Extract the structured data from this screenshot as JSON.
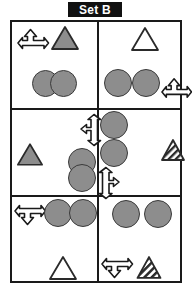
{
  "title": {
    "label": "Set B"
  },
  "colors": {
    "title_background": "#111111",
    "title_text": "#ffffff",
    "border": "#1a1a1a",
    "circle_fill": "#8d8d8d",
    "circle_stroke": "#3a3a3a",
    "triangle_gray_fill": "#8d8d8d",
    "triangle_white_fill": "#ffffff",
    "triangle_stroke": "#2a2a2a",
    "arrow_fill": "#ffffff",
    "arrow_stroke": "#1a1a1a",
    "background": "#ffffff"
  },
  "grid": {
    "rows": 3,
    "columns": 2,
    "cells": [
      {
        "id": "top-left",
        "objects": [
          {
            "kind": "arrow",
            "directions": "left-up-right",
            "name": "arrow-left-up-right"
          },
          {
            "kind": "triangle",
            "fill": "gray",
            "name": "triangle-gray"
          },
          {
            "kind": "circle",
            "fill": "gray",
            "name": "circle-gray"
          },
          {
            "kind": "circle",
            "fill": "gray",
            "name": "circle-gray"
          }
        ],
        "counts": {
          "arrows": 1,
          "triangles": 1,
          "circles": 2
        }
      },
      {
        "id": "top-right",
        "objects": [
          {
            "kind": "triangle",
            "fill": "white",
            "name": "triangle-white"
          },
          {
            "kind": "circle",
            "fill": "gray",
            "name": "circle-gray"
          },
          {
            "kind": "circle",
            "fill": "gray",
            "name": "circle-gray"
          },
          {
            "kind": "arrow",
            "directions": "left-up-right",
            "name": "arrow-left-up-right"
          }
        ],
        "counts": {
          "arrows": 1,
          "triangles": 1,
          "circles": 2
        }
      },
      {
        "id": "middle-left",
        "objects": [
          {
            "kind": "arrow",
            "directions": "left-up-down",
            "name": "arrow-left-up-down"
          },
          {
            "kind": "triangle",
            "fill": "gray",
            "name": "triangle-gray"
          },
          {
            "kind": "circle",
            "fill": "gray",
            "name": "circle-gray"
          },
          {
            "kind": "circle",
            "fill": "gray",
            "name": "circle-gray"
          }
        ],
        "counts": {
          "arrows": 1,
          "triangles": 1,
          "circles": 2
        }
      },
      {
        "id": "middle-right",
        "objects": [
          {
            "kind": "circle",
            "fill": "gray",
            "name": "circle-gray"
          },
          {
            "kind": "circle",
            "fill": "gray",
            "name": "circle-gray"
          },
          {
            "kind": "triangle",
            "fill": "hatched",
            "name": "triangle-hatched"
          },
          {
            "kind": "arrow",
            "directions": "up-right-down",
            "name": "arrow-up-right-down"
          }
        ],
        "counts": {
          "arrows": 1,
          "triangles": 1,
          "circles": 2
        }
      },
      {
        "id": "bottom-left",
        "objects": [
          {
            "kind": "arrow",
            "directions": "left-right-down",
            "name": "arrow-left-right-down"
          },
          {
            "kind": "circle",
            "fill": "gray",
            "name": "circle-gray"
          },
          {
            "kind": "circle",
            "fill": "gray",
            "name": "circle-gray"
          },
          {
            "kind": "triangle",
            "fill": "white",
            "name": "triangle-white"
          }
        ],
        "counts": {
          "arrows": 1,
          "triangles": 1,
          "circles": 2
        }
      },
      {
        "id": "bottom-right",
        "objects": [
          {
            "kind": "circle",
            "fill": "gray",
            "name": "circle-gray"
          },
          {
            "kind": "circle",
            "fill": "gray",
            "name": "circle-gray"
          },
          {
            "kind": "arrow",
            "directions": "left-right-down",
            "name": "arrow-left-right-down"
          },
          {
            "kind": "triangle",
            "fill": "hatched",
            "name": "triangle-hatched"
          }
        ],
        "counts": {
          "arrows": 1,
          "triangles": 1,
          "circles": 2
        }
      }
    ]
  }
}
